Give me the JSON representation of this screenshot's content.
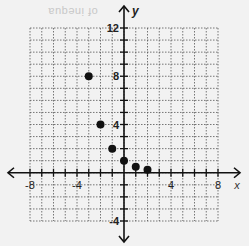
{
  "chart_data": {
    "type": "scatter",
    "title": "",
    "xlabel": "x",
    "ylabel": "y",
    "xlim": [
      -8,
      8
    ],
    "ylim": [
      -4,
      12
    ],
    "grid": true,
    "grid_style": "dotted",
    "x_ticks": [
      -8,
      -4,
      4,
      8
    ],
    "y_ticks": [
      12,
      8,
      4,
      -4
    ],
    "x_tick_labels": [
      "-8",
      "-4",
      "4",
      "8"
    ],
    "y_tick_labels": [
      "12",
      "8",
      "4",
      "-4"
    ],
    "series": [
      {
        "name": "points",
        "points": [
          {
            "x": -3,
            "y": 8
          },
          {
            "x": -2,
            "y": 4
          },
          {
            "x": -1,
            "y": 2
          },
          {
            "x": 0,
            "y": 1
          },
          {
            "x": 1,
            "y": 0.5
          },
          {
            "x": 2,
            "y": 0.25
          }
        ]
      }
    ],
    "legend": null
  },
  "colors": {
    "background": "#f2f2f2",
    "grid": "#555555",
    "axis": "#111111",
    "point": "#111111"
  },
  "bleed_text": "of inequa"
}
